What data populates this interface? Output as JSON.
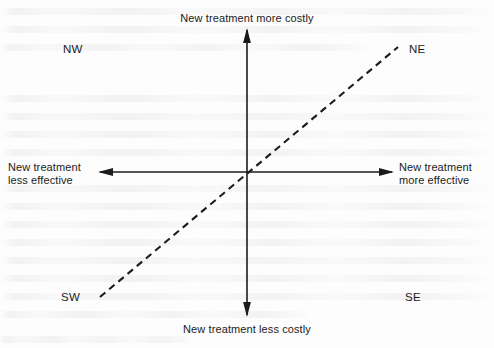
{
  "diagram": {
    "background_color": "#fdfdfd",
    "line_color": "#1b1b1b",
    "origin": {
      "x": 247,
      "y": 172
    },
    "axis_labels": {
      "top": "New treatment more costly",
      "bottom": "New treatment less costly",
      "left": "New treatment\nless effective",
      "right": "New treatment\nmore effective"
    },
    "quadrants": [
      {
        "code": "NW",
        "x": 63,
        "y": 43
      },
      {
        "code": "NE",
        "x": 409,
        "y": 43
      },
      {
        "code": "SW",
        "x": 61,
        "y": 291
      },
      {
        "code": "SE",
        "x": 405,
        "y": 291
      }
    ],
    "axes": {
      "vertical": {
        "x": 247,
        "y_top": 30,
        "y_bottom": 315,
        "arrow_top": true,
        "arrow_bottom": true
      },
      "horizontal": {
        "y": 172,
        "x_left": 100,
        "x_right": 392,
        "arrow_left": true,
        "arrow_right": true
      }
    },
    "threshold_line": {
      "style": "dashed",
      "slope_degrees": 45,
      "from": {
        "x": 100,
        "y": 297
      },
      "to": {
        "x": 398,
        "y": 47
      },
      "dash_length": 7,
      "gap_length": 5,
      "stroke_width": 2.1
    }
  }
}
